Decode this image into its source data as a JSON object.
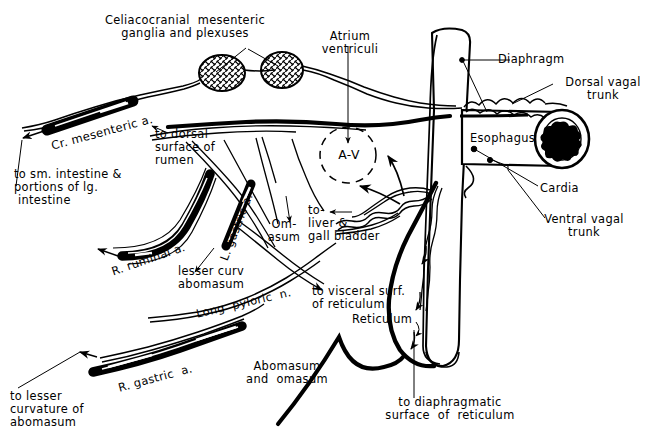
{
  "figure": {
    "type": "anatomical-line-diagram",
    "style": "black-and-white pen-and-ink line drawing",
    "width": 665,
    "height": 444,
    "background_color": "#ffffff",
    "ink_color": "#000000"
  },
  "labels": {
    "celiacocranial": "Celiacocranial  mesenteric\nganglia and plexuses",
    "atrium_ventriculi": "Atrium\nventriculi",
    "diaphragm": "Diaphragm",
    "dorsal_vagal_trunk": "Dorsal vagal\ntrunk",
    "esophagus": "Esophagus",
    "cardia": "Cardia",
    "ventral_vagal_trunk": "Ventral vagal\ntrunk",
    "av": "A-V",
    "cr_mesenteric": "Cr. mesenteric a.",
    "to_dorsal_rumen": "to dorsal\nsurface of\nrumen",
    "to_sm_intestine": "to sm. intestine &\nportions of lg.\n intestine",
    "r_ruminal": "R. ruminal a.",
    "l_gastric": "L. gastric a.",
    "omasum": "Om-\nasum",
    "to_liver_gall": "to-\nliver &\ngall bladder",
    "lesser_curv_abomasum": "lesser curv\nabomasum",
    "long_pyloric_n": "Long  pyloric  n.",
    "to_visceral_surf": "to visceral surf.\nof reticulum",
    "reticulum": "Reticulum",
    "r_gastric": "R. gastric  a.",
    "to_lesser_curvature": "to lesser\ncurvature of\nabomasum",
    "abomasum_and_omasum": "Abomasum\nand  omasum",
    "to_diaphragmatic": "to diaphragmatic\nsurface  of  reticulum"
  },
  "structures": {
    "ganglia": [
      "celiac-ganglion-left",
      "celiac-ganglion-right"
    ],
    "arteries": [
      "cranial-mesenteric-artery",
      "right-ruminal-artery",
      "left-gastric-artery",
      "right-gastric-artery"
    ],
    "organs": [
      "diaphragm",
      "esophagus",
      "reticulum",
      "abomasum-and-omasum"
    ],
    "nerves": [
      "dorsal-vagal-trunk",
      "ventral-vagal-trunk",
      "long-pyloric-nerve"
    ]
  }
}
